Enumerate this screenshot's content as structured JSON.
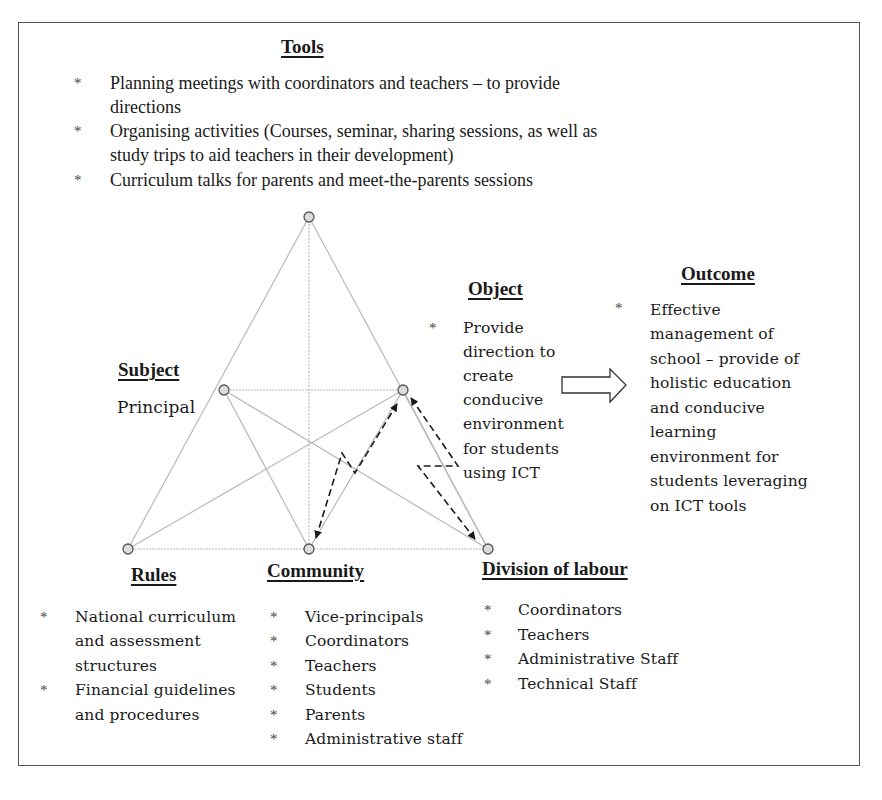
{
  "tools": {
    "heading": "Tools",
    "items": [
      {
        "lines": [
          "Planning meetings with coordinators and teachers – to provide",
          "directions"
        ]
      },
      {
        "lines": [
          "Organising activities (Courses, seminar, sharing sessions, as well as",
          "study trips to aid teachers in their development)"
        ]
      },
      {
        "lines": [
          "Curriculum talks for parents and meet-the-parents sessions"
        ]
      }
    ]
  },
  "subject": {
    "heading": "Subject",
    "value": "Principal"
  },
  "object": {
    "heading": "Object",
    "lines": [
      "Provide",
      "direction to",
      "create",
      "conducive",
      "environment",
      "for students",
      "using ICT"
    ]
  },
  "outcome": {
    "heading": "Outcome",
    "lines": [
      "Effective",
      "management of",
      "school – provide of",
      "holistic education",
      "and conducive",
      "learning",
      "environment for",
      "students leveraging",
      "on ICT tools"
    ]
  },
  "rules": {
    "heading": "Rules",
    "items": [
      {
        "lines": [
          "National curriculum",
          "and assessment",
          "structures"
        ]
      },
      {
        "lines": [
          "Financial guidelines",
          "and procedures"
        ]
      }
    ]
  },
  "community": {
    "heading": "Community",
    "items": [
      "Vice-principals",
      "Coordinators",
      "Teachers",
      "Students",
      "Parents",
      "Administrative staff"
    ]
  },
  "division_of_labour": {
    "heading": "Division of labour",
    "items": [
      "Coordinators",
      "Teachers",
      "Administrative Staff",
      "Technical Staff"
    ]
  },
  "bullet_glyph": "*",
  "nodes": {
    "tools": {
      "x": 309,
      "y": 217
    },
    "subject": {
      "x": 224,
      "y": 390
    },
    "object": {
      "x": 403,
      "y": 390
    },
    "rules": {
      "x": 128,
      "y": 549
    },
    "community": {
      "x": 309,
      "y": 549
    },
    "division": {
      "x": 488,
      "y": 549
    }
  },
  "colors": {
    "edge": "#b8b8b8",
    "node_fill": "#dcdcdc",
    "node_stroke": "#555555",
    "arrow": "#1a1a1a",
    "frame": "#555555"
  }
}
